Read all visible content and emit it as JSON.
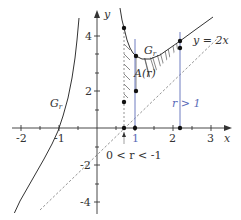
{
  "figure": {
    "axes": {
      "x_label": "x",
      "y_label": "y",
      "x_ticks": [
        {
          "value": -2,
          "label": "-2"
        },
        {
          "value": -1,
          "label": "-1"
        },
        {
          "value": 1,
          "label": "1"
        },
        {
          "value": 2,
          "label": "2"
        },
        {
          "value": 3,
          "label": "3"
        }
      ],
      "y_ticks": [
        {
          "value": 4,
          "label": "4"
        },
        {
          "value": 2,
          "label": "2"
        },
        {
          "value": -2,
          "label": "-2"
        },
        {
          "value": -4,
          "label": "-4"
        }
      ]
    },
    "labels": {
      "curve_left": "G",
      "curve_left_sub": "r",
      "curve_right": "G",
      "curve_right_sub": "r",
      "asymptote": "y = 2x",
      "area": "A(r)",
      "case_small": "0 < r < -1",
      "case_large": "r > 1"
    },
    "colors": {
      "curve": "#333333",
      "axis": "#333333",
      "asymptote": "#888888",
      "vertical_lines": "#6f7cc0",
      "hatch": "#555555"
    }
  }
}
